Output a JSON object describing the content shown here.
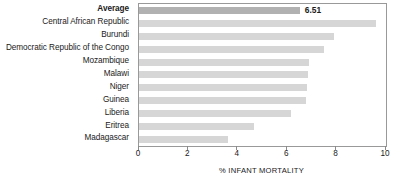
{
  "chart_data": {
    "type": "bar",
    "orientation": "horizontal",
    "title": "",
    "xlabel": "% INFANT MORTALITY",
    "ylabel": "",
    "xlim": [
      0,
      10
    ],
    "xticks": [
      0,
      2,
      4,
      6,
      8,
      10
    ],
    "xtick_labels": [
      "0",
      "2",
      "4",
      "6",
      "8",
      "10"
    ],
    "grid": false,
    "legend": null,
    "categories": [
      "Average",
      "Central African Republic",
      "Burundi",
      "Democratic Republic of the Congo",
      "Mozambique",
      "Malawi",
      "Niger",
      "Guinea",
      "Liberia",
      "Eritrea",
      "Madagascar"
    ],
    "values": [
      6.51,
      9.6,
      7.9,
      7.5,
      6.9,
      6.85,
      6.8,
      6.75,
      6.15,
      4.65,
      3.6
    ],
    "data_labels": [
      "6.51",
      "",
      "",
      "",
      "",
      "",
      "",
      "",
      "",
      "",
      ""
    ],
    "emphasis_index": 0,
    "colors": {
      "bar": "#d6d6d6",
      "bar_emphasis": "#b1b1b1",
      "axis": "#999999",
      "text": "#1a1a1a",
      "background": "#ffffff"
    }
  }
}
